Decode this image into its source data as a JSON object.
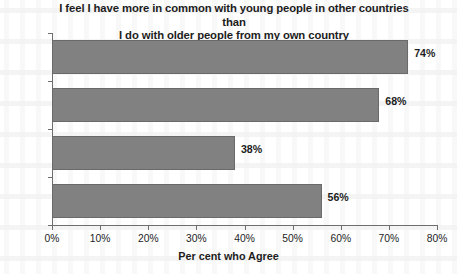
{
  "chart_data": {
    "type": "bar",
    "orientation": "horizontal",
    "title": "I feel I have more in common with young people in other countries than\nI do with older people from my own country",
    "categories": [
      "China",
      "India",
      "Russia",
      "Brazil"
    ],
    "values": [
      74,
      68,
      38,
      56
    ],
    "value_labels": [
      "74%",
      "68%",
      "38%",
      "56%"
    ],
    "xlabel": "Per cent who Agree",
    "ylabel": "",
    "xlim": [
      0,
      80
    ],
    "xtick_values": [
      0,
      10,
      20,
      30,
      40,
      50,
      60,
      70,
      80
    ],
    "xtick_labels": [
      "0%",
      "10%",
      "20%",
      "30%",
      "40%",
      "50%",
      "60%",
      "70%",
      "80%"
    ],
    "grid": false,
    "legend": false,
    "bar_color": "#818181",
    "bar_edge_color": "#6a6a6a",
    "axis_color": "#6e6e6e",
    "text_color": "#1d1d1d",
    "background_color": "#ffffff"
  }
}
